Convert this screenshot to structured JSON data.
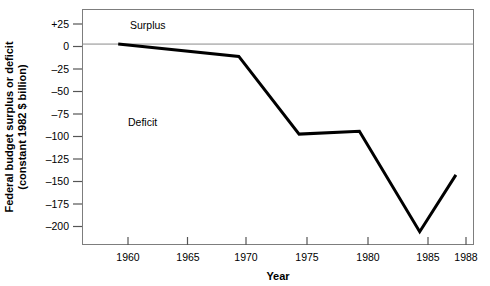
{
  "chart_data": {
    "type": "line",
    "title": "",
    "subtitle": "",
    "xlabel": "Year",
    "ylabel": "Federal budget surplus or deficit (constant 1982 $ billion)",
    "ylabel_line1": "Federal budget surplus or deficit",
    "ylabel_line2": "(constant 1982 $ billion)",
    "x": [
      1960,
      1970,
      1975,
      1980,
      1985,
      1988
    ],
    "values": [
      0,
      -13,
      -95,
      -92,
      -198,
      -138
    ],
    "series": [
      {
        "name": "Federal budget surplus or deficit",
        "x": [
          1960,
          1970,
          1975,
          1980,
          1985,
          1988
        ],
        "values": [
          0,
          -13,
          -95,
          -92,
          -198,
          -138
        ],
        "color": "#000000"
      }
    ],
    "xlim": [
      1957,
      1989.5
    ],
    "ylim": [
      -212,
      37
    ],
    "xticks": [
      1960,
      1965,
      1970,
      1975,
      1980,
      1985,
      1988
    ],
    "xtick_labels": [
      "1960",
      "1965",
      "1970",
      "1975",
      "1980",
      "1985",
      "1988"
    ],
    "yticks": [
      25,
      0,
      -25,
      -50,
      -75,
      -100,
      -125,
      -150,
      -175,
      -200
    ],
    "ytick_labels": [
      "+25",
      "0",
      "–25",
      "–50",
      "–75",
      "–100",
      "–125",
      "–150",
      "–175",
      "–200"
    ],
    "grid": false,
    "legend": "none",
    "zero_line": 0,
    "annotations": [
      {
        "text": "Surplus",
        "x": 1962.5,
        "y": 19
      },
      {
        "text": "Deficit",
        "x": 1962.0,
        "y": -85
      }
    ]
  },
  "axes": {
    "x_title": "Year",
    "y_title_line1": "Federal budget surplus or deficit",
    "y_title_line2": "(constant 1982 $ billion)"
  },
  "ticks": {
    "y": [
      "+25",
      "0",
      "–25",
      "–50",
      "–75",
      "–100",
      "–125",
      "–150",
      "–175",
      "–200"
    ],
    "x": [
      "1960",
      "1965",
      "1970",
      "1975",
      "1980",
      "1985",
      "1988"
    ]
  },
  "annotations": {
    "surplus": "Surplus",
    "deficit": "Deficit"
  },
  "colors": {
    "line": "#000000",
    "frame": "#7a7a7a",
    "background": "#ffffff",
    "zero_line": "#8a8a8a"
  }
}
